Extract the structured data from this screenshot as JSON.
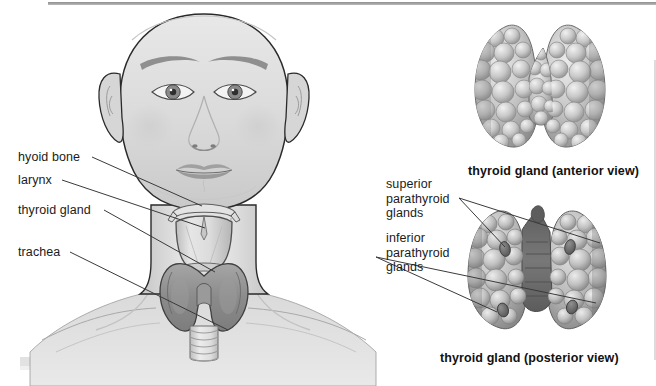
{
  "figure": {
    "title_anterior": "thyroid gland (anterior view)",
    "title_posterior": "thyroid gland (posterior view)",
    "style": "grayscale medical illustration"
  },
  "colors": {
    "background": "#ffffff",
    "skin_light": "#e4e4e4",
    "skin_mid": "#cfcfcf",
    "skin_shadow": "#b4b4b4",
    "outline": "#2a2a2a",
    "cartilage": "#d8d8d8",
    "thyroid_dark": "#8d8d8d",
    "thyroid_mid": "#a8a8a8",
    "gland_light": "#dcdcdc",
    "gland_mid": "#b6b6b6",
    "gland_dark": "#7e7e7e",
    "parathyroid": "#6e6e6e",
    "leader_line": "#3a3a3a",
    "text": "#1b1b1b",
    "rule": "#8e8e8e"
  },
  "left_panel": {
    "name": "head-and-neck-anterior-illustration",
    "labels": [
      {
        "id": "hyoid-bone",
        "text": "hyoid bone",
        "x": 18,
        "y": 150,
        "line": [
          [
            92,
            157
          ],
          [
            202,
            206
          ]
        ]
      },
      {
        "id": "larynx",
        "text": "larynx",
        "x": 18,
        "y": 173,
        "line": [
          [
            62,
            180
          ],
          [
            205,
            228
          ]
        ]
      },
      {
        "id": "thyroid-gland",
        "text": "thyroid gland",
        "x": 18,
        "y": 203,
        "line": [
          [
            104,
            210
          ],
          [
            215,
            272
          ]
        ]
      },
      {
        "id": "trachea",
        "text": "trachea",
        "x": 18,
        "y": 245,
        "line": [
          [
            70,
            252
          ],
          [
            228,
            330
          ]
        ]
      }
    ]
  },
  "right_panel": {
    "anterior": {
      "name": "thyroid-gland-anterior-illustration",
      "caption": "thyroid gland (anterior view)",
      "caption_x": 468,
      "caption_y": 164
    },
    "posterior": {
      "name": "thyroid-gland-posterior-illustration",
      "caption": "thyroid gland (posterior view)",
      "caption_x": 440,
      "caption_y": 351
    },
    "labels": [
      {
        "id": "superior-parathyroid-glands",
        "text": "superior\nparathyroid\nglands",
        "x": 386,
        "y": 177,
        "anchor": [
          459,
          198
        ],
        "pointers": [
          [
            600,
            243
          ],
          [
            505,
            247
          ]
        ]
      },
      {
        "id": "inferior-parathyroid-glands",
        "text": "inferior\nparathyroid\nglands",
        "x": 386,
        "y": 231,
        "anchor": [
          376,
          257
        ],
        "pointers": [
          [
            596,
            303
          ],
          [
            497,
            312
          ]
        ]
      }
    ]
  },
  "anatomy_structures": [
    "hyoid bone",
    "larynx",
    "thyroid gland",
    "trachea",
    "superior parathyroid glands",
    "inferior parathyroid glands"
  ]
}
